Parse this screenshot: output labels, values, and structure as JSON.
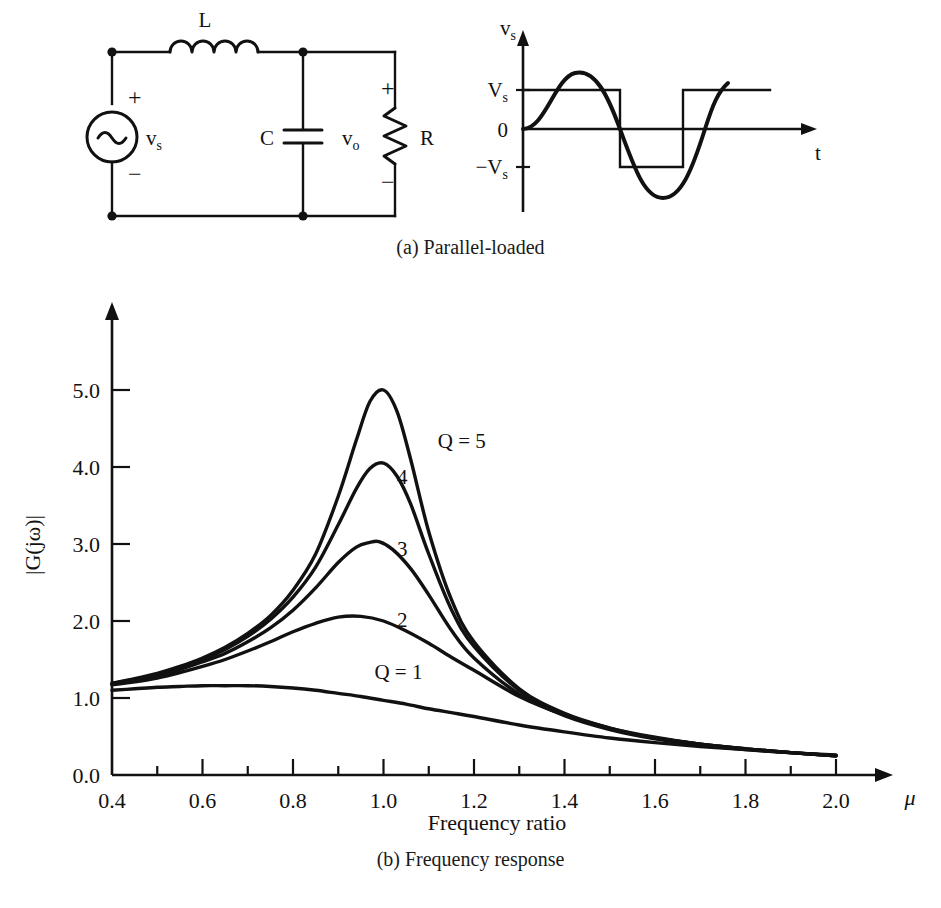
{
  "figure": {
    "captions": {
      "a": "(a) Parallel-loaded",
      "b": "(b) Frequency response"
    }
  },
  "circuit": {
    "title_note": "parallel-loaded resonant circuit",
    "labels": {
      "inductor": "L",
      "capacitor": "C",
      "resistor": "R",
      "source_voltage": "v",
      "source_voltage_sub": "s",
      "output_voltage": "v",
      "output_voltage_sub": "o",
      "plus_source": "+",
      "minus_source": "−",
      "plus_output": "+",
      "minus_output": "−"
    }
  },
  "waveform": {
    "labels": {
      "y_axis": "v",
      "y_axis_sub": "s",
      "x_axis": "t",
      "level_pos": "V",
      "level_pos_sub": "s",
      "level_zero": "0",
      "level_neg": "−V",
      "level_neg_sub": "s"
    }
  },
  "chart_data": {
    "type": "line",
    "title": "",
    "xlabel": "Frequency ratio",
    "ylabel": "|G(jω)|",
    "x_axis_symbol": "μ",
    "xlim": [
      0.4,
      2.0
    ],
    "ylim": [
      0.0,
      5.6
    ],
    "grid": false,
    "legend_position": "inline-labels",
    "xticks": [
      0.4,
      0.6,
      0.8,
      1.0,
      1.2,
      1.4,
      1.6,
      1.8,
      2.0
    ],
    "xtick_labels": [
      "0.4",
      "0.6",
      "0.8",
      "1.0",
      "1.2",
      "1.4",
      "1.6",
      "1.8",
      "2.0"
    ],
    "xminor_ticks": [
      0.5,
      0.7,
      0.9,
      1.1,
      1.3,
      1.5,
      1.7,
      1.9
    ],
    "yticks": [
      0.0,
      1.0,
      2.0,
      3.0,
      4.0,
      5.0
    ],
    "ytick_labels": [
      "0.0",
      "1.0",
      "2.0",
      "3.0",
      "4.0",
      "5.0"
    ],
    "annotations": [
      {
        "text": "Q = 5",
        "x": 1.12,
        "y": 4.25
      },
      {
        "text": "4",
        "x": 1.03,
        "y": 3.78
      },
      {
        "text": "3",
        "x": 1.03,
        "y": 2.85
      },
      {
        "text": "2",
        "x": 1.03,
        "y": 1.92
      },
      {
        "text": "Q = 1",
        "x": 0.98,
        "y": 1.25
      }
    ],
    "series": [
      {
        "name": "Q = 5",
        "q": 5,
        "peak": {
          "x": 1.0,
          "y": 5.0
        },
        "x": [
          0.4,
          0.45,
          0.5,
          0.55,
          0.6,
          0.65,
          0.7,
          0.75,
          0.8,
          0.85,
          0.9,
          0.94,
          0.97,
          1.0,
          1.03,
          1.06,
          1.1,
          1.15,
          1.2,
          1.3,
          1.4,
          1.5,
          1.6,
          1.7,
          1.8,
          1.9,
          2.0
        ],
        "values": [
          1.19,
          1.25,
          1.32,
          1.41,
          1.52,
          1.66,
          1.84,
          2.07,
          2.4,
          2.87,
          3.62,
          4.35,
          4.85,
          5.0,
          4.72,
          4.1,
          3.16,
          2.28,
          1.73,
          1.12,
          0.8,
          0.61,
          0.48,
          0.4,
          0.34,
          0.29,
          0.25
        ]
      },
      {
        "name": "4",
        "q": 4,
        "peak": {
          "x": 1.0,
          "y": 4.05
        },
        "x": [
          0.4,
          0.45,
          0.5,
          0.55,
          0.6,
          0.65,
          0.7,
          0.75,
          0.8,
          0.85,
          0.9,
          0.94,
          0.97,
          1.0,
          1.03,
          1.06,
          1.1,
          1.15,
          1.2,
          1.3,
          1.4,
          1.5,
          1.6,
          1.7,
          1.8,
          1.9,
          2.0
        ],
        "values": [
          1.19,
          1.24,
          1.31,
          1.4,
          1.5,
          1.63,
          1.8,
          2.02,
          2.31,
          2.7,
          3.25,
          3.72,
          3.98,
          4.05,
          3.88,
          3.52,
          2.87,
          2.15,
          1.67,
          1.1,
          0.79,
          0.6,
          0.48,
          0.4,
          0.34,
          0.29,
          0.25
        ]
      },
      {
        "name": "3",
        "q": 3,
        "peak": {
          "x": 0.99,
          "y": 3.03
        },
        "x": [
          0.4,
          0.45,
          0.5,
          0.55,
          0.6,
          0.65,
          0.7,
          0.75,
          0.8,
          0.85,
          0.9,
          0.94,
          0.97,
          0.99,
          1.02,
          1.06,
          1.1,
          1.15,
          1.2,
          1.3,
          1.4,
          1.5,
          1.6,
          1.7,
          1.8,
          1.9,
          2.0
        ],
        "values": [
          1.18,
          1.23,
          1.29,
          1.37,
          1.47,
          1.58,
          1.73,
          1.91,
          2.14,
          2.43,
          2.76,
          2.96,
          3.02,
          3.03,
          2.93,
          2.68,
          2.34,
          1.88,
          1.52,
          1.05,
          0.77,
          0.59,
          0.47,
          0.39,
          0.33,
          0.29,
          0.25
        ]
      },
      {
        "name": "2",
        "q": 2,
        "peak": {
          "x": 0.95,
          "y": 2.06
        },
        "x": [
          0.4,
          0.45,
          0.5,
          0.55,
          0.6,
          0.65,
          0.7,
          0.75,
          0.8,
          0.85,
          0.9,
          0.95,
          1.0,
          1.05,
          1.1,
          1.15,
          1.2,
          1.3,
          1.4,
          1.5,
          1.6,
          1.7,
          1.8,
          1.9,
          2.0
        ],
        "values": [
          1.17,
          1.21,
          1.26,
          1.33,
          1.41,
          1.5,
          1.61,
          1.73,
          1.86,
          1.97,
          2.05,
          2.06,
          2.0,
          1.87,
          1.71,
          1.53,
          1.36,
          1.02,
          0.78,
          0.61,
          0.49,
          0.4,
          0.34,
          0.29,
          0.25
        ]
      },
      {
        "name": "Q = 1",
        "q": 1,
        "peak": {
          "x": 0.7,
          "y": 1.16
        },
        "x": [
          0.4,
          0.45,
          0.5,
          0.55,
          0.6,
          0.65,
          0.7,
          0.75,
          0.8,
          0.85,
          0.9,
          0.95,
          1.0,
          1.05,
          1.1,
          1.15,
          1.2,
          1.3,
          1.4,
          1.5,
          1.6,
          1.7,
          1.8,
          1.9,
          2.0
        ],
        "values": [
          1.1,
          1.12,
          1.14,
          1.15,
          1.16,
          1.16,
          1.16,
          1.15,
          1.13,
          1.1,
          1.06,
          1.02,
          0.97,
          0.92,
          0.86,
          0.81,
          0.76,
          0.65,
          0.56,
          0.48,
          0.42,
          0.37,
          0.33,
          0.29,
          0.26
        ]
      }
    ]
  },
  "colors": {
    "ink": "#111111",
    "background": "#ffffff"
  }
}
